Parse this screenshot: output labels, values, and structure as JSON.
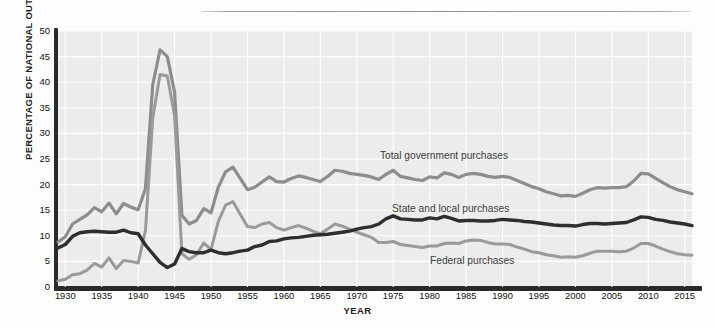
{
  "chart_data": {
    "type": "line",
    "title": "",
    "xlabel": "YEAR",
    "ylabel": "PERCENTAGE OF NATIONAL OUTPUT",
    "xlim": [
      1929,
      2016
    ],
    "ylim": [
      0,
      50
    ],
    "ytick_values": [
      0,
      5,
      10,
      15,
      20,
      25,
      30,
      35,
      40,
      45,
      50
    ],
    "xtick_values": [
      1930,
      1935,
      1940,
      1945,
      1950,
      1955,
      1960,
      1965,
      1970,
      1975,
      1980,
      1985,
      1990,
      1995,
      2000,
      2005,
      2010,
      2015
    ],
    "grid": true,
    "legend_position": "inline-annotations",
    "x": [
      1929,
      1930,
      1931,
      1932,
      1933,
      1934,
      1935,
      1936,
      1937,
      1938,
      1939,
      1940,
      1941,
      1942,
      1943,
      1944,
      1945,
      1946,
      1947,
      1948,
      1949,
      1950,
      1951,
      1952,
      1953,
      1954,
      1955,
      1956,
      1957,
      1958,
      1959,
      1960,
      1961,
      1962,
      1963,
      1964,
      1965,
      1966,
      1967,
      1968,
      1969,
      1970,
      1971,
      1972,
      1973,
      1974,
      1975,
      1976,
      1977,
      1978,
      1979,
      1980,
      1981,
      1982,
      1983,
      1984,
      1985,
      1986,
      1987,
      1988,
      1989,
      1990,
      1991,
      1992,
      1993,
      1994,
      1995,
      1996,
      1997,
      1998,
      1999,
      2000,
      2001,
      2002,
      2003,
      2004,
      2005,
      2006,
      2007,
      2008,
      2009,
      2010,
      2011,
      2012,
      2013,
      2014,
      2015,
      2016
    ],
    "series": [
      {
        "name": "Total government purchases",
        "color": "#8d8d8d",
        "width": 3.2,
        "values": [
          8.8,
          9.8,
          12.3,
          13.2,
          14.1,
          15.5,
          14.7,
          16.4,
          14.3,
          16.3,
          15.6,
          15.1,
          19.2,
          39.5,
          46.3,
          45.0,
          38.0,
          14.0,
          12.3,
          13.0,
          15.3,
          14.5,
          19.5,
          22.5,
          23.4,
          21.2,
          19.0,
          19.5,
          20.5,
          21.5,
          20.6,
          20.5,
          21.2,
          21.7,
          21.4,
          21.0,
          20.6,
          21.6,
          22.8,
          22.6,
          22.2,
          22.0,
          21.8,
          21.5,
          21.0,
          22.0,
          22.8,
          21.6,
          21.3,
          21.0,
          20.8,
          21.5,
          21.3,
          22.3,
          22.0,
          21.4,
          22.0,
          22.2,
          22.0,
          21.6,
          21.4,
          21.6,
          21.4,
          20.8,
          20.2,
          19.6,
          19.2,
          18.6,
          18.2,
          17.8,
          17.9,
          17.7,
          18.3,
          19.0,
          19.4,
          19.3,
          19.4,
          19.4,
          19.6,
          20.7,
          22.2,
          22.1,
          21.2,
          20.4,
          19.6,
          19.0,
          18.6,
          18.2
        ]
      },
      {
        "name": "Federal purchases",
        "color": "#9a9a9a",
        "width": 3.0,
        "values": [
          1.2,
          1.5,
          2.4,
          2.6,
          3.3,
          4.6,
          3.9,
          5.7,
          3.6,
          5.2,
          5.0,
          4.7,
          11.0,
          33.0,
          41.5,
          41.2,
          33.5,
          6.5,
          5.4,
          6.3,
          8.6,
          7.3,
          12.8,
          16.0,
          16.7,
          14.2,
          11.8,
          11.6,
          12.3,
          12.6,
          11.6,
          11.1,
          11.6,
          12.0,
          11.5,
          10.9,
          10.4,
          11.3,
          12.3,
          11.9,
          11.3,
          10.7,
          10.2,
          9.7,
          8.7,
          8.7,
          8.9,
          8.3,
          8.1,
          7.9,
          7.7,
          8.0,
          8.0,
          8.5,
          8.6,
          8.5,
          9.0,
          9.2,
          9.1,
          8.7,
          8.4,
          8.4,
          8.3,
          7.8,
          7.4,
          6.9,
          6.7,
          6.3,
          6.1,
          5.8,
          5.9,
          5.8,
          6.1,
          6.6,
          7.0,
          7.0,
          7.0,
          6.9,
          7.0,
          7.6,
          8.5,
          8.5,
          8.0,
          7.4,
          6.9,
          6.5,
          6.3,
          6.2
        ]
      },
      {
        "name": "State and local purchases",
        "color": "#2e2e2e",
        "width": 3.4,
        "values": [
          7.6,
          8.3,
          9.9,
          10.6,
          10.8,
          10.9,
          10.8,
          10.7,
          10.7,
          11.1,
          10.6,
          10.4,
          8.2,
          6.5,
          4.8,
          3.8,
          4.5,
          7.5,
          6.9,
          6.7,
          6.7,
          7.2,
          6.7,
          6.5,
          6.7,
          7.0,
          7.2,
          7.9,
          8.2,
          8.9,
          9.0,
          9.4,
          9.6,
          9.7,
          9.9,
          10.1,
          10.2,
          10.3,
          10.5,
          10.7,
          10.9,
          11.3,
          11.6,
          11.8,
          12.3,
          13.3,
          13.9,
          13.3,
          13.2,
          13.1,
          13.1,
          13.5,
          13.3,
          13.8,
          13.4,
          12.9,
          13.0,
          13.0,
          12.9,
          12.9,
          13.0,
          13.2,
          13.1,
          13.0,
          12.8,
          12.7,
          12.5,
          12.3,
          12.1,
          12.0,
          12.0,
          11.9,
          12.2,
          12.4,
          12.4,
          12.3,
          12.4,
          12.5,
          12.6,
          13.1,
          13.7,
          13.6,
          13.2,
          13.0,
          12.7,
          12.5,
          12.3,
          12.0
        ]
      }
    ],
    "annotations": [
      {
        "text": "Total government purchases",
        "x_px": 380,
        "y_px": 150
      },
      {
        "text": "State and local purchases",
        "x_px": 392,
        "y_px": 203
      },
      {
        "text": "Federal purchases",
        "x_px": 430,
        "y_px": 255
      }
    ]
  },
  "axes": {
    "y_title": "PERCENTAGE OF NATIONAL OUTPUT",
    "x_title": "YEAR"
  }
}
